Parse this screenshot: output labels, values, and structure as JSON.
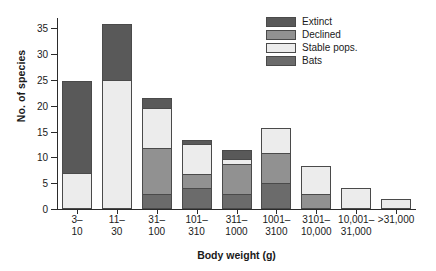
{
  "chart_data": {
    "type": "bar",
    "subtype": "stacked-bar",
    "title": "",
    "xlabel": "Body weight (g)",
    "ylabel": "No. of species",
    "ylim": [
      0,
      37
    ],
    "yticks": [
      0,
      5,
      10,
      15,
      20,
      25,
      30,
      35
    ],
    "grid": false,
    "legend_position": "top-right",
    "categories": [
      "3–\n10",
      "11–\n30",
      "31–\n100",
      "101–\n310",
      "311–\n1000",
      "1001–\n3100",
      "3101–\n10,000",
      "10,001–\n31,000",
      ">31,000"
    ],
    "category_lines": [
      [
        "3–",
        "10"
      ],
      [
        "11–",
        "30"
      ],
      [
        "31–",
        "100"
      ],
      [
        "101–",
        "310"
      ],
      [
        "311–",
        "1000"
      ],
      [
        "1001–",
        "3100"
      ],
      [
        "3101–",
        "10,000"
      ],
      [
        "10,001–",
        "31,000"
      ],
      [
        ">31,000",
        ""
      ]
    ],
    "series": [
      {
        "name": "Bats",
        "color": "#6b6b6b",
        "values": [
          0,
          0,
          3,
          4,
          3,
          5,
          0,
          0,
          0
        ]
      },
      {
        "name": "Declined",
        "color": "#919191",
        "values": [
          0,
          0,
          9,
          3,
          6,
          6,
          3,
          0,
          0
        ]
      },
      {
        "name": "Stable pops.",
        "color": "#ececec",
        "values": [
          7,
          25,
          8,
          6,
          1,
          5,
          5.5,
          4,
          2
        ]
      },
      {
        "name": "Extinct",
        "color": "#595959",
        "values": [
          18,
          11,
          2,
          1,
          2,
          0,
          0,
          0,
          0
        ]
      }
    ],
    "stack_order_bottom_to_top": [
      "Bats",
      "Declined",
      "Stable pops.",
      "Extinct"
    ],
    "totals": [
      25,
      36,
      22,
      14,
      12,
      16,
      8.5,
      4,
      2
    ]
  },
  "legend": {
    "items": [
      {
        "label": "Extinct",
        "color": "#595959"
      },
      {
        "label": "Declined",
        "color": "#919191"
      },
      {
        "label": "Stable pops.",
        "color": "#ececec"
      },
      {
        "label": "Bats",
        "color": "#6b6b6b"
      }
    ]
  },
  "axes": {
    "y_title": "No. of species",
    "x_title": "Body weight (g)",
    "y_tick_labels": [
      "0",
      "5",
      "10",
      "15",
      "20",
      "25",
      "30",
      "35"
    ]
  }
}
